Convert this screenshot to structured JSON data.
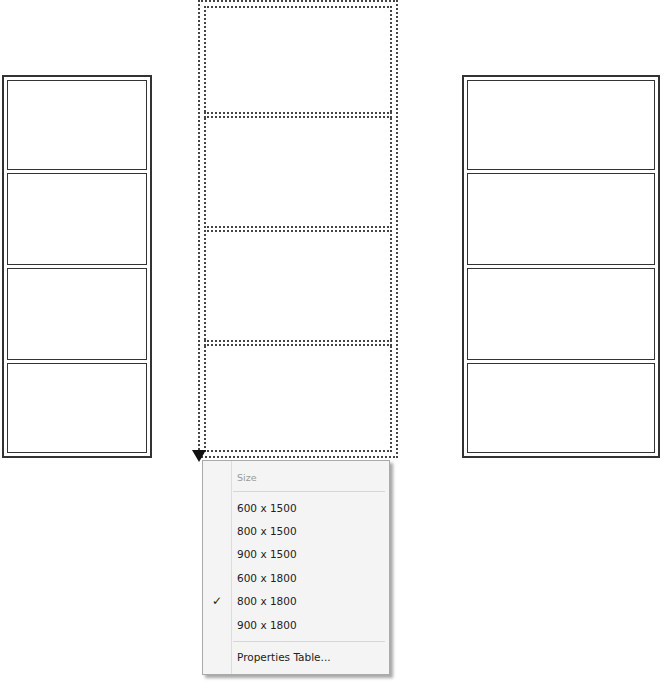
{
  "canvas": {
    "left_frame": {
      "panels": 4,
      "style": "solid-double"
    },
    "middle_frame": {
      "panels": 4,
      "style": "dashed-selected"
    },
    "right_frame": {
      "panels": 4,
      "style": "solid-double"
    }
  },
  "context_menu": {
    "header": "Size",
    "items": [
      {
        "label": "600 x 1500",
        "checked": false
      },
      {
        "label": "800 x 1500",
        "checked": false
      },
      {
        "label": "900 x 1500",
        "checked": false
      },
      {
        "label": "600 x 1800",
        "checked": false
      },
      {
        "label": "800 x 1800",
        "checked": true
      },
      {
        "label": "900 x 1800",
        "checked": false
      }
    ],
    "check_glyph": "✓",
    "footer": "Properties Table..."
  }
}
